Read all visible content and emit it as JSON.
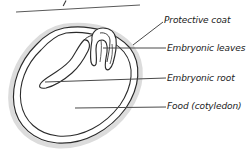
{
  "diagram": {
    "colors": {
      "outline": "#2b2b2b",
      "seed_coat_halo": "#d9d9d9",
      "leader_line": "#4a4a4a",
      "text": "#1a1a1a",
      "background": "#ffffff"
    },
    "labels": [
      {
        "id": "protective-coat",
        "text": "Protective coat",
        "leader": {
          "x1": 133,
          "y1": 45,
          "x2": 163,
          "y2": 22
        }
      },
      {
        "id": "embryonic-leaves",
        "text": "Embryonic leaves",
        "leader": {
          "x1": 103,
          "y1": 48,
          "x2": 166,
          "y2": 48
        }
      },
      {
        "id": "embryonic-root",
        "text": "Embryonic root",
        "leader": {
          "x1": 45,
          "y1": 82,
          "x2": 166,
          "y2": 78
        }
      },
      {
        "id": "food-cotyledon",
        "text": "Food (cotyledon)",
        "leader": {
          "x1": 75,
          "y1": 108,
          "x2": 166,
          "y2": 107
        }
      }
    ],
    "top_crop_line": {
      "id": "cropped-leader-line",
      "x1": 16,
      "y1": 12,
      "x2": 140,
      "y2": 5
    },
    "top_crop_tick": {
      "id": "cropped-tick-mark",
      "x1": 66,
      "y1": 1,
      "x2": 63,
      "y2": 6
    }
  }
}
